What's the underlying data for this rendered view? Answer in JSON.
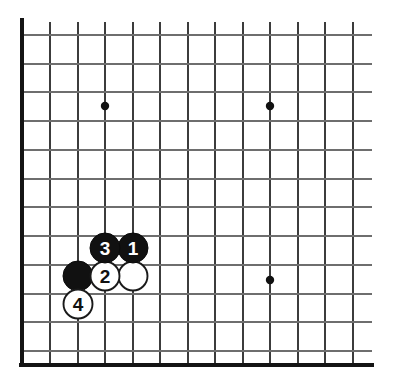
{
  "diagram": {
    "kind": "go-board-diagram",
    "board_region": "lower-left corner",
    "background_color": "#ffffff",
    "line_color": "#6e6e6e",
    "border_color": "#141414",
    "black_color": "#111111",
    "white_color": "#ffffff"
  },
  "grid": {
    "vertical_line_x": [
      22,
      50,
      78,
      105,
      133,
      160,
      188,
      215,
      243,
      270,
      298,
      325,
      353
    ],
    "horizontal_line_y": [
      35,
      64,
      92,
      121,
      150,
      179,
      207,
      236,
      265,
      294,
      322,
      351,
      365
    ],
    "vertical_line_top": 22,
    "vertical_line_bottom": 365,
    "horizontal_line_left": 22,
    "horizontal_line_right": 372,
    "cell_size": 27.6,
    "left_border_x": 22,
    "bottom_border_y": 365,
    "line_count_vertical": 13,
    "line_count_horizontal": 12
  },
  "hoshi_points": [
    {
      "name": "hoshi-upper-left",
      "cx": 105,
      "cy": 106
    },
    {
      "name": "hoshi-upper-right",
      "cx": 270,
      "cy": 106
    },
    {
      "name": "hoshi-lower-right",
      "cx": 270,
      "cy": 280
    }
  ],
  "stones": [
    {
      "id": "stone-black-unnumbered",
      "color": "black",
      "label": "",
      "cx": 78,
      "cy": 276,
      "r": 15
    },
    {
      "id": "stone-white-unnumbered",
      "color": "white",
      "label": "",
      "cx": 133,
      "cy": 276,
      "r": 14.5
    },
    {
      "id": "stone-move-1",
      "color": "black",
      "label": "1",
      "cx": 133,
      "cy": 248,
      "r": 15
    },
    {
      "id": "stone-move-2",
      "color": "white",
      "label": "2",
      "cx": 105,
      "cy": 276,
      "r": 14.5
    },
    {
      "id": "stone-move-3",
      "color": "black",
      "label": "3",
      "cx": 105,
      "cy": 248,
      "r": 15
    },
    {
      "id": "stone-move-4",
      "color": "white",
      "label": "4",
      "cx": 78,
      "cy": 304,
      "r": 14.5
    }
  ],
  "move_labels": {
    "one": "1",
    "two": "2",
    "three": "3",
    "four": "4"
  }
}
